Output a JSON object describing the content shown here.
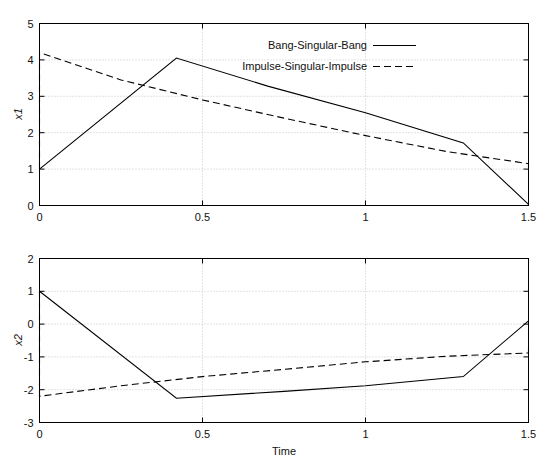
{
  "figure": {
    "background_color": "#ffffff",
    "line_color": "#000000",
    "grid_color": "#b9b9b9"
  },
  "legend": {
    "position": "top-center-right",
    "entries": [
      {
        "label": "Bang-Singular-Bang",
        "style": "solid"
      },
      {
        "label": "Impulse-Singular-Impulse",
        "style": "dashed"
      }
    ]
  },
  "chart_data": [
    {
      "type": "line",
      "title": "",
      "xlabel": "",
      "ylabel": "x1",
      "xlim": [
        0,
        1.5
      ],
      "ylim": [
        0,
        5
      ],
      "xticks": [
        0,
        0.5,
        1,
        1.5
      ],
      "xticklabels": [
        "0",
        "0.5",
        "1",
        "1.5"
      ],
      "yticks": [
        0,
        1,
        2,
        3,
        4,
        5
      ],
      "yticklabels": [
        "0",
        "1",
        "2",
        "3",
        "4",
        "5"
      ],
      "grid": true,
      "legend_position": "upper right",
      "series": [
        {
          "name": "Bang-Singular-Bang",
          "style": "solid",
          "x": [
            0,
            0.42,
            0.7,
            1.0,
            1.3,
            1.5
          ],
          "y": [
            1.0,
            4.05,
            3.28,
            2.55,
            1.72,
            0.03
          ]
        },
        {
          "name": "Impulse-Singular-Impulse",
          "style": "dashed",
          "x": [
            0,
            0,
            0.25,
            0.5,
            0.75,
            1.0,
            1.25,
            1.5,
            1.5
          ],
          "y": [
            1.0,
            4.2,
            3.45,
            2.9,
            2.4,
            1.92,
            1.48,
            1.15,
            1.02
          ]
        }
      ]
    },
    {
      "type": "line",
      "title": "",
      "xlabel": "Time",
      "ylabel": "x2",
      "xlim": [
        0,
        1.5
      ],
      "ylim": [
        -3,
        2
      ],
      "xticks": [
        0,
        0.5,
        1,
        1.5
      ],
      "xticklabels": [
        "0",
        "0.5",
        "1",
        "1.5"
      ],
      "yticks": [
        -3,
        -2,
        -1,
        0,
        1,
        2
      ],
      "yticklabels": [
        "-3",
        "-2",
        "-1",
        "0",
        "1",
        "2"
      ],
      "grid": true,
      "series": [
        {
          "name": "Bang-Singular-Bang",
          "style": "solid",
          "x": [
            0,
            0.42,
            0.75,
            1.0,
            1.3,
            1.5
          ],
          "y": [
            1.0,
            -2.26,
            -2.05,
            -1.88,
            -1.6,
            0.1
          ]
        },
        {
          "name": "Impulse-Singular-Impulse",
          "style": "dashed",
          "x": [
            0,
            0,
            0.25,
            0.5,
            0.75,
            1.0,
            1.25,
            1.5,
            1.5
          ],
          "y": [
            1.0,
            -2.2,
            -1.88,
            -1.6,
            -1.38,
            -1.15,
            -0.98,
            -0.88,
            -0.7
          ]
        }
      ]
    }
  ]
}
